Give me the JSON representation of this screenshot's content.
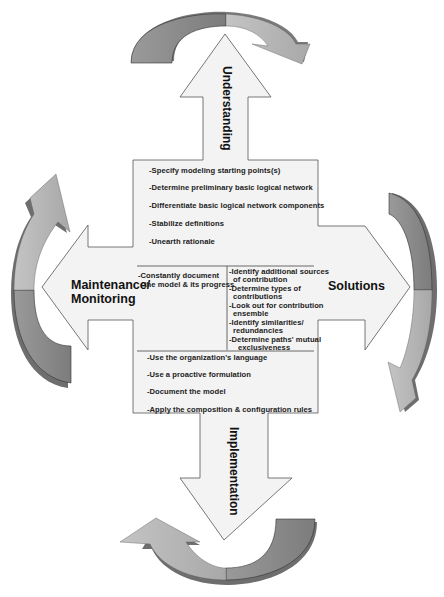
{
  "colors": {
    "arrow_fill": "#f2f2f2",
    "arrow_stroke": "#555555",
    "curve_light": "#b5b5b5",
    "curve_dark": "#8a8a8a",
    "curve_shadow": "#6e6e6e",
    "text": "#111111"
  },
  "arrows": {
    "up": {
      "label": "Understanding",
      "direction": "up"
    },
    "down": {
      "label": "Implementation",
      "direction": "down"
    },
    "left": {
      "label_line1": "Maintenance/",
      "label_line2": "Monitoring",
      "direction": "left"
    },
    "right": {
      "label": "Solutions",
      "direction": "right"
    }
  },
  "center": {
    "understanding_items": [
      "-Specify modeling  starting points(s)",
      "-Determine preliminary basic logical network",
      "-Differentiate basic  logical network components",
      "-Stabilize  definitions",
      "-Unearth rationale"
    ],
    "maintenance_items": [
      "-Constantly document",
      "the model & its progress"
    ],
    "solutions_items": [
      "-Identify additional sources",
      "of contribution",
      "-Determine types  of",
      "contributions",
      "-Look out for contribution",
      "ensemble",
      "-Identify similarities/",
      "redundancies",
      "-Determine paths' mutual",
      "exclusiveness"
    ],
    "implementation_items": [
      "-Use the organization's language",
      "-Use a proactive formulation",
      "-Document the model",
      "-Apply the composition & configuration rules"
    ]
  },
  "cycle_arrows": [
    {
      "position": "top",
      "icon": "curved-arrow-clockwise"
    },
    {
      "position": "right",
      "icon": "curved-arrow-clockwise"
    },
    {
      "position": "bottom",
      "icon": "curved-arrow-clockwise"
    },
    {
      "position": "left",
      "icon": "curved-arrow-clockwise"
    }
  ]
}
